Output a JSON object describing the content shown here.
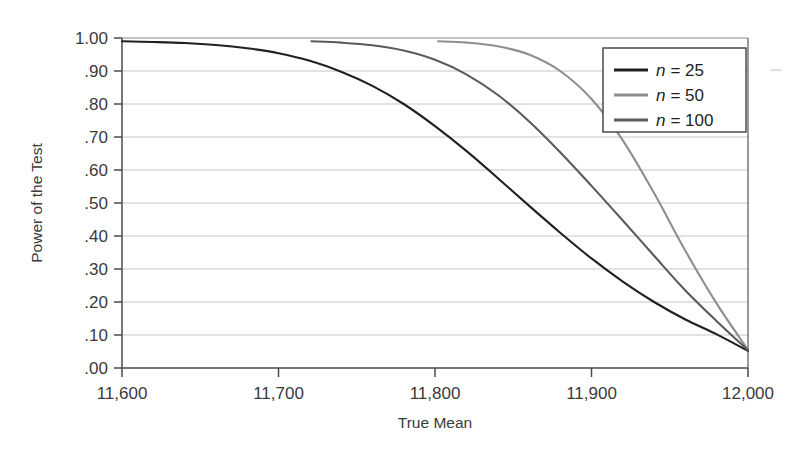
{
  "chart_data": {
    "type": "line",
    "title": "",
    "subtitle": "",
    "xlabel": "True Mean",
    "ylabel": "Power of the Test",
    "xlim": [
      11600,
      12000
    ],
    "ylim": [
      0.0,
      1.0
    ],
    "grid": true,
    "grid_axis": "y",
    "legend_position": "top-right",
    "xticks": [
      11600,
      11700,
      11800,
      11900,
      12000
    ],
    "xtick_labels": [
      "11,600",
      "11,700",
      "11,800",
      "11,900",
      "12,000"
    ],
    "yticks": [
      0.0,
      0.1,
      0.2,
      0.3,
      0.4,
      0.5,
      0.6,
      0.7,
      0.8,
      0.9,
      1.0
    ],
    "ytick_labels": [
      ".00",
      ".10",
      ".20",
      ".30",
      ".40",
      ".50",
      ".60",
      ".70",
      ".80",
      ".90",
      "1.00"
    ],
    "series": [
      {
        "name": "n = 25",
        "legend_label_prefix": "n",
        "legend_label_suffix": "= 25",
        "color": "#231f20",
        "linewidth": 2.1,
        "x": [
          11600,
          11620,
          11640,
          11660,
          11680,
          11700,
          11720,
          11740,
          11760,
          11780,
          11800,
          11820,
          11840,
          11860,
          11880,
          11900,
          11920,
          11940,
          11960,
          11980,
          12000
        ],
        "y": [
          0.99,
          0.988,
          0.985,
          0.979,
          0.969,
          0.954,
          0.931,
          0.898,
          0.855,
          0.8,
          0.733,
          0.658,
          0.576,
          0.492,
          0.41,
          0.332,
          0.262,
          0.2,
          0.147,
          0.102,
          0.052
        ]
      },
      {
        "name": "n = 50",
        "legend_label_prefix": "n",
        "legend_label_suffix": "= 50",
        "color": "#8e8e90",
        "linewidth": 2.1,
        "x": [
          11802,
          11820,
          11840,
          11860,
          11880,
          11900,
          11920,
          11940,
          11960,
          11980,
          12000
        ],
        "y": [
          0.99,
          0.986,
          0.975,
          0.95,
          0.9,
          0.815,
          0.69,
          0.53,
          0.355,
          0.195,
          0.055
        ]
      },
      {
        "name": "n = 100",
        "legend_label_prefix": "n",
        "legend_label_suffix": "= 100",
        "color": "#5b595c",
        "linewidth": 2.1,
        "x": [
          11721,
          11740,
          11760,
          11780,
          11800,
          11820,
          11840,
          11860,
          11880,
          11900,
          11920,
          11940,
          11960,
          11980,
          12000
        ],
        "y": [
          0.99,
          0.986,
          0.978,
          0.962,
          0.934,
          0.89,
          0.828,
          0.748,
          0.654,
          0.552,
          0.447,
          0.34,
          0.235,
          0.142,
          0.054
        ]
      }
    ],
    "annotations": []
  },
  "legend": {
    "entries": [
      {
        "label": "n = 25",
        "var": "n",
        "rest": "= 25",
        "swatch_color": "#231f20"
      },
      {
        "label": "n = 50",
        "var": "n",
        "rest": "= 50",
        "swatch_color": "#8e8e90"
      },
      {
        "label": "n = 100",
        "var": "n",
        "rest": "= 100",
        "swatch_color": "#5b595c"
      }
    ]
  },
  "colors": {
    "frame": "#4a4a4c",
    "gridline": "#bfbfc1",
    "tick": "#4a4a4c",
    "text": "#3b3a3c",
    "background": "#ffffff"
  }
}
